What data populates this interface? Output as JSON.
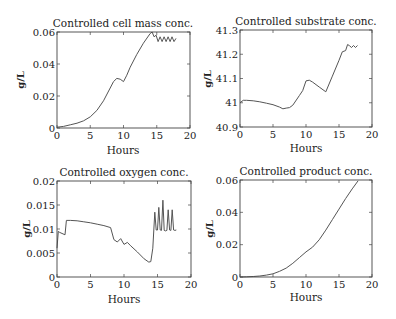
{
  "chart_data": [
    {
      "type": "line",
      "title": "Controlled cell mass conc.",
      "xlabel": "Hours",
      "ylabel": "g/L",
      "xlim": [
        0,
        20
      ],
      "ylim": [
        0,
        0.06
      ],
      "xticks": [
        0,
        5,
        10,
        15,
        20
      ],
      "yticks": [
        0,
        0.02,
        0.04,
        0.06
      ],
      "yticklabels": [
        "0",
        "0.02",
        "0.04",
        "0.06"
      ],
      "grid": false,
      "box": {
        "x0": 57,
        "y0": 32,
        "x1": 190,
        "y1": 128
      },
      "x": [
        0,
        1,
        2,
        3,
        4,
        5,
        6,
        7,
        8,
        8.5,
        9,
        9.5,
        10,
        10.5,
        11,
        12,
        13,
        14,
        14.3,
        14.6,
        14.9,
        15.2,
        15.5,
        15.8,
        16.1,
        16.4,
        16.7,
        17,
        17.3,
        17.6,
        17.9
      ],
      "y": [
        0.0005,
        0.001,
        0.002,
        0.003,
        0.0045,
        0.007,
        0.011,
        0.017,
        0.025,
        0.029,
        0.031,
        0.0305,
        0.029,
        0.033,
        0.038,
        0.046,
        0.053,
        0.059,
        0.06,
        0.057,
        0.058,
        0.054,
        0.057,
        0.054,
        0.057,
        0.054,
        0.057,
        0.054,
        0.057,
        0.054,
        0.056
      ]
    },
    {
      "type": "line",
      "title": "Controlled substrate conc.",
      "xlabel": "Hours",
      "ylabel": "g/L",
      "xlim": [
        0,
        20
      ],
      "ylim": [
        40.9,
        41.3
      ],
      "xticks": [
        0,
        5,
        10,
        15,
        20
      ],
      "yticks": [
        40.9,
        41,
        41.1,
        41.2,
        41.3
      ],
      "yticklabels": [
        "40.9",
        "41",
        "41.1",
        "41.2",
        "41.3"
      ],
      "grid": false,
      "box": {
        "x0": 240,
        "y0": 30,
        "x1": 372,
        "y1": 127
      },
      "x": [
        0,
        0.5,
        1,
        2,
        3,
        4,
        5,
        6,
        6.5,
        7,
        7.5,
        8,
        9,
        9.5,
        10,
        10.5,
        11,
        12,
        13,
        14,
        15,
        15.5,
        16,
        16.3,
        16.6,
        16.9,
        17.2,
        17.5,
        17.8
      ],
      "y": [
        41.0,
        41.01,
        41.01,
        41.008,
        41.004,
        40.998,
        40.992,
        40.982,
        40.975,
        40.978,
        40.98,
        40.99,
        41.03,
        41.05,
        41.09,
        41.093,
        41.085,
        41.065,
        41.045,
        41.11,
        41.175,
        41.21,
        41.215,
        41.24,
        41.235,
        41.228,
        41.236,
        41.228,
        41.236
      ]
    },
    {
      "type": "line",
      "title": "Controlled oxygen conc.",
      "xlabel": "Hours",
      "ylabel": "g/L",
      "xlim": [
        0,
        20
      ],
      "ylim": [
        0,
        0.02
      ],
      "xticks": [
        0,
        5,
        10,
        15,
        20
      ],
      "yticks": [
        0,
        0.005,
        0.01,
        0.015,
        0.02
      ],
      "yticklabels": [
        "0",
        "0.005",
        "0.01",
        "0.015",
        "0.02"
      ],
      "grid": false,
      "box": {
        "x0": 57,
        "y0": 181,
        "x1": 191,
        "y1": 277
      },
      "x": [
        0,
        0.2,
        0.4,
        1.2,
        1.4,
        2,
        3,
        4,
        5,
        6,
        7,
        8,
        8.5,
        9,
        9.5,
        10,
        10.5,
        11,
        12,
        13,
        13.7,
        14,
        14.3,
        14.6,
        14.8,
        15,
        15.2,
        15.4,
        15.6,
        15.8,
        16,
        16.2,
        16.4,
        16.6,
        16.8,
        17,
        17.2,
        17.4,
        17.6,
        17.8
      ],
      "y": [
        0.006,
        0.0095,
        0.0093,
        0.0088,
        0.0118,
        0.0118,
        0.0117,
        0.0115,
        0.0113,
        0.011,
        0.0107,
        0.0103,
        0.0078,
        0.0073,
        0.008,
        0.0068,
        0.0072,
        0.0065,
        0.0052,
        0.0038,
        0.0031,
        0.0032,
        0.006,
        0.0135,
        0.0098,
        0.0098,
        0.0145,
        0.0098,
        0.0097,
        0.016,
        0.0097,
        0.0096,
        0.0097,
        0.014,
        0.0098,
        0.0097,
        0.014,
        0.0098,
        0.0097,
        0.0098
      ]
    },
    {
      "type": "line",
      "title": "Controlled product conc.",
      "xlabel": "Hours",
      "ylabel": "g/L",
      "xlim": [
        0,
        20
      ],
      "ylim": [
        0,
        0.06
      ],
      "xticks": [
        0,
        5,
        10,
        15,
        20
      ],
      "yticks": [
        0,
        0.02,
        0.04,
        0.06
      ],
      "yticklabels": [
        "0",
        "0.02",
        "0.04",
        "0.06"
      ],
      "grid": false,
      "box": {
        "x0": 240,
        "y0": 180,
        "x1": 372,
        "y1": 277
      },
      "x": [
        0,
        1,
        2,
        3,
        4,
        5,
        6,
        7,
        8,
        9,
        10,
        11,
        12,
        13,
        14,
        15,
        16,
        17,
        17.9
      ],
      "y": [
        0,
        0.0001,
        0.0003,
        0.0006,
        0.0012,
        0.002,
        0.0035,
        0.0055,
        0.0085,
        0.012,
        0.0155,
        0.0185,
        0.023,
        0.029,
        0.0355,
        0.042,
        0.0485,
        0.0545,
        0.0595
      ]
    }
  ]
}
